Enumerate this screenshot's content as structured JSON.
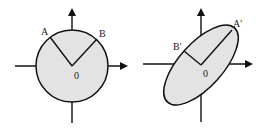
{
  "figures": [
    {
      "name": "circle",
      "labels": {
        "a": "A",
        "b": "B",
        "origin": "0"
      }
    },
    {
      "name": "ellipse",
      "labels": {
        "a": "A'",
        "b": "B'",
        "origin": "0"
      }
    }
  ],
  "colors": {
    "fill": "#e3e3e3",
    "stroke": "#111111"
  }
}
